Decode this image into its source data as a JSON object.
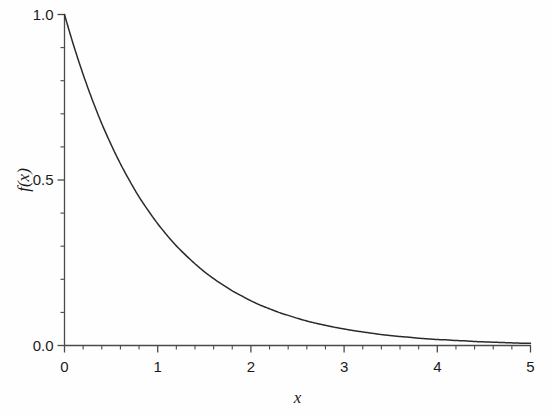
{
  "chart_data": {
    "type": "line",
    "title": "",
    "subtitle": "",
    "xlabel": "x",
    "ylabel": "f(x)",
    "xlim": [
      0,
      5
    ],
    "ylim": [
      0.0,
      1.0
    ],
    "grid": false,
    "legend": null,
    "legend_position": "none",
    "xticks": [
      0,
      1,
      2,
      3,
      4,
      5
    ],
    "xtick_labels": [
      "0",
      "1",
      "2",
      "3",
      "4",
      "5"
    ],
    "x_minor_tick_interval": 0.2,
    "yticks": [
      0.0,
      0.5,
      1.0
    ],
    "ytick_labels": [
      "0.0",
      "0.5",
      "1.0"
    ],
    "y_minor_tick_interval": 0.1,
    "line_color": "#2b2b2b",
    "background_color": "#ffffff",
    "axis_color": "#4a4a4a",
    "series": [
      {
        "name": "f(x) = exp(-x)",
        "x": [
          0.0,
          0.1,
          0.2,
          0.3,
          0.4,
          0.5,
          0.6,
          0.7,
          0.8,
          0.9,
          1.0,
          1.1,
          1.2,
          1.3,
          1.4,
          1.5,
          1.6,
          1.7,
          1.8,
          1.9,
          2.0,
          2.1,
          2.2,
          2.3,
          2.4,
          2.5,
          2.6,
          2.7,
          2.8,
          2.9,
          3.0,
          3.1,
          3.2,
          3.3,
          3.4,
          3.5,
          3.6,
          3.7,
          3.8,
          3.9,
          4.0,
          4.1,
          4.2,
          4.3,
          4.4,
          4.5,
          4.6,
          4.7,
          4.8,
          4.9,
          5.0
        ],
        "values": [
          1.0,
          0.905,
          0.819,
          0.741,
          0.67,
          0.607,
          0.549,
          0.497,
          0.449,
          0.407,
          0.368,
          0.333,
          0.301,
          0.273,
          0.247,
          0.223,
          0.202,
          0.183,
          0.165,
          0.15,
          0.135,
          0.122,
          0.111,
          0.1,
          0.091,
          0.082,
          0.074,
          0.067,
          0.061,
          0.055,
          0.05,
          0.045,
          0.041,
          0.037,
          0.033,
          0.03,
          0.027,
          0.025,
          0.022,
          0.02,
          0.018,
          0.017,
          0.015,
          0.014,
          0.012,
          0.011,
          0.01,
          0.009,
          0.008,
          0.007,
          0.007
        ]
      }
    ]
  },
  "axes": {
    "y_labels": [
      {
        "text": "1.0",
        "value": 1.0
      },
      {
        "text": "0.5",
        "value": 0.5
      },
      {
        "text": "0.0",
        "value": 0.0
      }
    ],
    "x_labels": [
      {
        "text": "0",
        "value": 0
      },
      {
        "text": "1",
        "value": 1
      },
      {
        "text": "2",
        "value": 2
      },
      {
        "text": "3",
        "value": 3
      },
      {
        "text": "4",
        "value": 4
      },
      {
        "text": "5",
        "value": 5
      }
    ],
    "x_title": "x",
    "y_title": "f(x)"
  }
}
